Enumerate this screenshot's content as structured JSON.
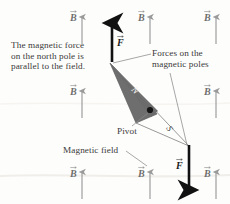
{
  "figure": {
    "background_color": "#fdfdfc",
    "needle_color": "#6e6e6e",
    "field_arrow_color": "#9a9a9a",
    "force_arrow_color": "#111111",
    "text_color": "#3a3a3a"
  },
  "annotations": {
    "magnetic_force_note": "The magnetic force\non the north pole is\nparallel to the field.",
    "forces_on_poles": "Forces on the\nmagnetic poles",
    "pivot": "Pivot",
    "magnetic_field": "Magnetic field"
  },
  "symbols": {
    "field_vector": "B",
    "force_vector": "F",
    "north_pole": "N",
    "south_pole": "S"
  },
  "field_vectors": [
    {
      "name": "field-vector-top-left",
      "label": "B",
      "x": 76,
      "y": 14
    },
    {
      "name": "field-vector-top-middle",
      "label": "B",
      "x": 144,
      "y": 14
    },
    {
      "name": "field-vector-top-right",
      "label": "B",
      "x": 210,
      "y": 14
    },
    {
      "name": "field-vector-middle-left",
      "label": "B",
      "x": 76,
      "y": 88
    },
    {
      "name": "field-vector-middle-right",
      "label": "B",
      "x": 210,
      "y": 88
    },
    {
      "name": "field-vector-bottom-left",
      "label": "B",
      "x": 76,
      "y": 170
    },
    {
      "name": "field-vector-bottom-middle",
      "label": "B",
      "x": 144,
      "y": 170
    },
    {
      "name": "field-vector-bottom-right",
      "label": "B",
      "x": 210,
      "y": 170
    }
  ],
  "force_vectors": [
    {
      "name": "force-vector-north-pole",
      "label": "F",
      "direction": "up",
      "x": 112,
      "y_tail": 62,
      "y_head": 20
    },
    {
      "name": "force-vector-south-pole",
      "label": "F",
      "direction": "down",
      "x": 189,
      "y_tail": 145,
      "y_head": 192
    }
  ],
  "needle": {
    "north_label": "N",
    "south_label": "S",
    "pivot_label": "Pivot"
  }
}
